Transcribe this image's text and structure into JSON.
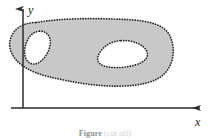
{
  "figure": {
    "kind": "math-region-diagram",
    "axes": {
      "x_label": "x",
      "y_label": "y",
      "origin_px": [
        23,
        108
      ],
      "x_axis_end_px": [
        205,
        108
      ],
      "y_axis_end_px": [
        23,
        5
      ],
      "axis_color": "#2b2b2b",
      "arrowheads": true
    },
    "region": {
      "description": "shaded multiply-connected region with two holes",
      "fill_color": "#c8c8c8",
      "boundary_style": "dotted",
      "boundary_color": "#1c1c1c",
      "hole_count": 2,
      "holes": [
        {
          "name": "left-hole",
          "fill_color": "#ffffff",
          "bbox_px": [
            25,
            30,
            25,
            34
          ]
        },
        {
          "name": "right-hole",
          "fill_color": "#ffffff",
          "bbox_px": [
            97,
            40,
            50,
            28
          ]
        }
      ],
      "outer_bbox_px": [
        10,
        18,
        163,
        70
      ]
    },
    "caption": {
      "label": "Figure",
      "text": "(cut off)",
      "visible": "partial"
    }
  }
}
